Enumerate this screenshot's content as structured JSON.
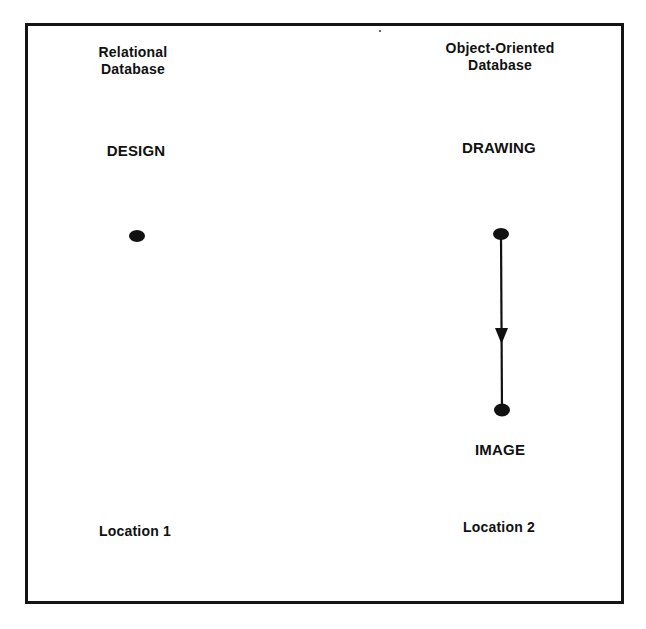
{
  "diagram": {
    "type": "database-relationship-comparison",
    "frame": {
      "stroke_color": "#141414",
      "background": "#ffffff"
    },
    "columns": [
      {
        "id": "relational",
        "title_line1": "Relational",
        "title_line2": "Database",
        "entities": [
          {
            "label": "DESIGN",
            "node": {
              "x": 137,
              "y": 236
            }
          }
        ],
        "location": "Location 1"
      },
      {
        "id": "object-oriented",
        "title_line1": "Object-Oriented",
        "title_line2": "Database",
        "entities": [
          {
            "label": "DRAWING",
            "node": {
              "x": 501,
              "y": 234
            }
          },
          {
            "label": "IMAGE",
            "node": {
              "x": 502,
              "y": 410
            }
          }
        ],
        "edges": [
          {
            "from": "DRAWING",
            "to": "IMAGE",
            "directed": true,
            "arrow_position": "middle"
          }
        ],
        "location": "Location 2"
      }
    ]
  }
}
